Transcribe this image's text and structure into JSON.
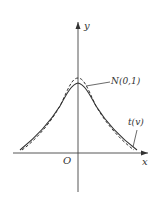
{
  "figure": {
    "axes": {
      "x_label": "x",
      "y_label": "y",
      "origin_label": "O"
    },
    "curves": [
      {
        "name": "normal",
        "label": "N(0,1)",
        "style": "dashed"
      },
      {
        "name": "t",
        "label": "t(v)",
        "style": "solid"
      }
    ],
    "colors": {
      "line": "#333333",
      "background": "#ffffff"
    }
  }
}
